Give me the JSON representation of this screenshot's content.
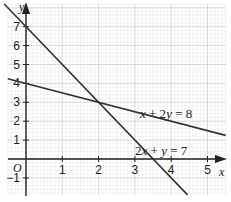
{
  "graph": {
    "x_axis_label": "x",
    "y_axis_label": "y",
    "origin_label": "O",
    "x_ticks": [
      {
        "value": 1,
        "label": "1"
      },
      {
        "value": 2,
        "label": "2"
      },
      {
        "value": 3,
        "label": "3"
      },
      {
        "value": 4,
        "label": "4"
      },
      {
        "value": 5,
        "label": "5"
      }
    ],
    "y_ticks": [
      {
        "value": -1,
        "label": "−1"
      },
      {
        "value": 1,
        "label": "1"
      },
      {
        "value": 2,
        "label": "2"
      },
      {
        "value": 3,
        "label": "3"
      },
      {
        "value": 4,
        "label": "4"
      },
      {
        "value": 5,
        "label": "5"
      },
      {
        "value": 6,
        "label": "6"
      },
      {
        "value": 7,
        "label": "7"
      }
    ],
    "lines": [
      {
        "equation": "x + 2y = 8",
        "label": "x + 2y = 8",
        "color": "#333333"
      },
      {
        "equation": "2x + y = 7",
        "label": "2x + y = 7",
        "color": "#333333"
      }
    ],
    "intersection": {
      "x": 2,
      "y": 3
    },
    "colors": {
      "grid_minor": "#e4e4e4",
      "grid_major": "#cfcfcf",
      "axis": "#222222"
    }
  }
}
